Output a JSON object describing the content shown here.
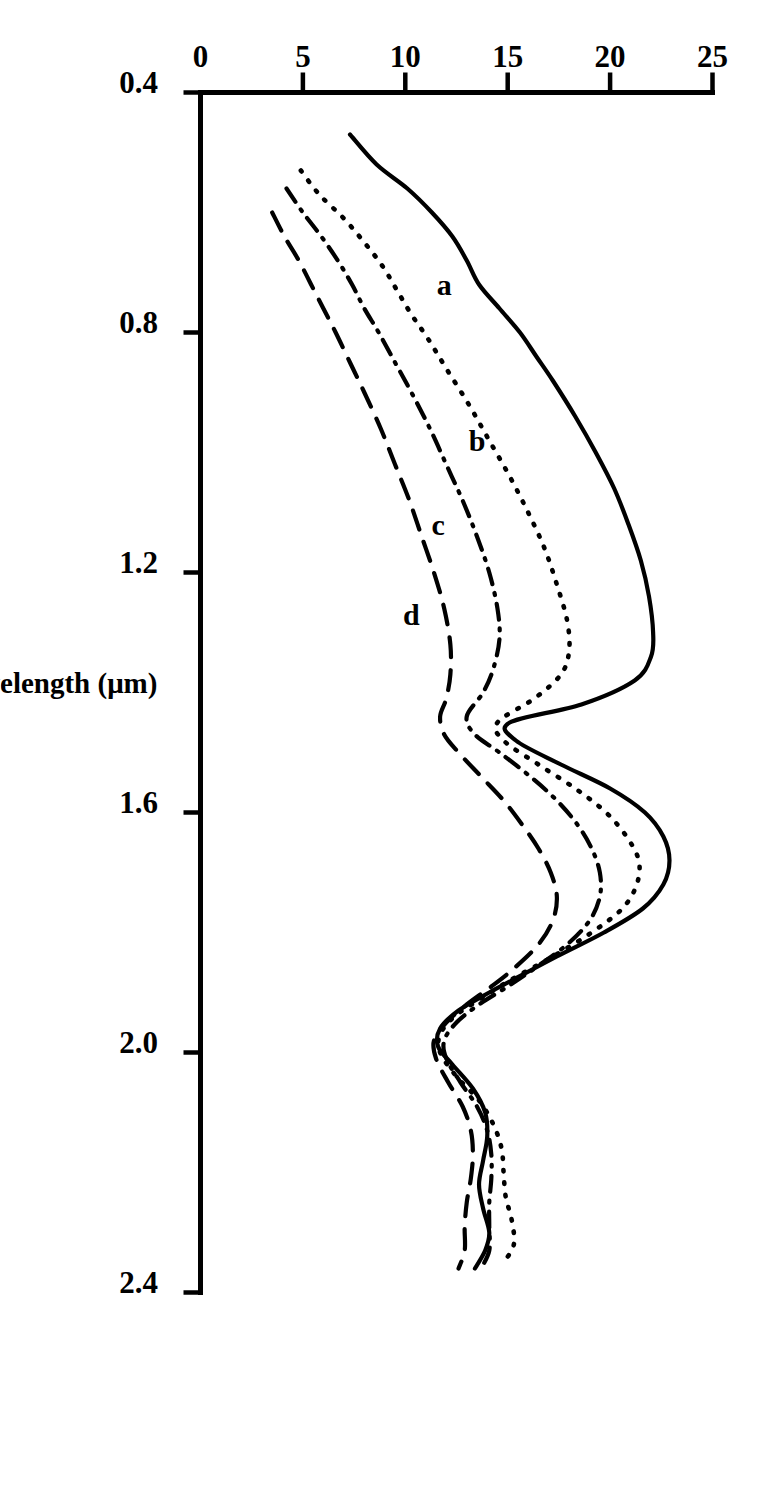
{
  "figure": {
    "rotation_degrees": 90,
    "background_color": "#ffffff",
    "ink_color": "#000000"
  },
  "chart_data": {
    "type": "line",
    "title": "",
    "xlabel": "Wavelength (μm)",
    "ylabel": "Reflectance factor (%)",
    "xlim": [
      0.4,
      2.4
    ],
    "ylim": [
      0,
      25
    ],
    "xticks": [
      "0.4",
      "0.8",
      "1.2",
      "1.6",
      "2.0",
      "2.4"
    ],
    "xtick_values": [
      0.4,
      0.8,
      1.2,
      1.6,
      2.0,
      2.4
    ],
    "yticks": [
      "0",
      "5",
      "10",
      "15",
      "20",
      "25"
    ],
    "ytick_values": [
      0,
      5,
      10,
      15,
      20,
      25
    ],
    "grid": false,
    "legend_position": "inline-curve-labels",
    "series": [
      {
        "name": "a",
        "label": "a",
        "linestyle": "solid",
        "label_x": 0.72,
        "label_y": 11.9,
        "x": [
          0.47,
          0.52,
          0.56,
          0.6,
          0.64,
          0.68,
          0.72,
          0.76,
          0.8,
          0.84,
          0.88,
          0.94,
          1.0,
          1.06,
          1.12,
          1.18,
          1.24,
          1.3,
          1.34,
          1.38,
          1.42,
          1.45,
          1.48,
          1.52,
          1.56,
          1.6,
          1.64,
          1.68,
          1.72,
          1.76,
          1.8,
          1.84,
          1.88,
          1.9,
          1.93,
          1.96,
          1.99,
          2.02,
          2.06,
          2.1,
          2.14,
          2.18,
          2.22,
          2.26,
          2.3,
          2.33,
          2.36
        ],
        "y": [
          7.3,
          8.6,
          10.1,
          11.3,
          12.3,
          13.0,
          13.6,
          14.6,
          15.6,
          16.4,
          17.2,
          18.3,
          19.3,
          20.2,
          20.9,
          21.5,
          21.9,
          22.1,
          22.0,
          21.2,
          18.6,
          15.1,
          15.4,
          17.6,
          20.0,
          21.7,
          22.6,
          22.9,
          22.6,
          21.6,
          19.7,
          17.4,
          15.2,
          14.1,
          12.6,
          11.7,
          11.6,
          12.3,
          13.3,
          13.9,
          14.0,
          13.8,
          13.6,
          13.8,
          14.1,
          13.9,
          13.4
        ]
      },
      {
        "name": "b",
        "label": "b",
        "linestyle": "dotted",
        "label_x": 0.98,
        "label_y": 13.5,
        "x": [
          0.53,
          0.57,
          0.61,
          0.65,
          0.69,
          0.73,
          0.77,
          0.81,
          0.86,
          0.92,
          0.98,
          1.04,
          1.1,
          1.16,
          1.22,
          1.28,
          1.33,
          1.37,
          1.41,
          1.45,
          1.48,
          1.52,
          1.56,
          1.6,
          1.64,
          1.68,
          1.72,
          1.76,
          1.8,
          1.84,
          1.88,
          1.91,
          1.94,
          1.97,
          2.0,
          2.04,
          2.08,
          2.12,
          2.16,
          2.2,
          2.24,
          2.28,
          2.32,
          2.35
        ],
        "y": [
          4.9,
          5.8,
          7.0,
          8.0,
          8.9,
          9.6,
          10.3,
          11.1,
          12.0,
          13.1,
          14.1,
          15.1,
          16.0,
          16.8,
          17.4,
          17.9,
          18.0,
          17.6,
          16.3,
          14.5,
          14.8,
          16.5,
          18.3,
          19.8,
          20.8,
          21.4,
          21.3,
          20.6,
          19.1,
          17.2,
          15.1,
          13.7,
          12.4,
          11.7,
          11.7,
          12.5,
          13.6,
          14.3,
          14.7,
          14.8,
          14.9,
          15.2,
          15.3,
          14.8
        ]
      },
      {
        "name": "c",
        "label": "c",
        "linestyle": "dash-dot",
        "label_x": 1.12,
        "label_y": 11.6,
        "x": [
          0.56,
          0.6,
          0.64,
          0.68,
          0.72,
          0.76,
          0.8,
          0.85,
          0.9,
          0.96,
          1.02,
          1.08,
          1.14,
          1.2,
          1.26,
          1.31,
          1.36,
          1.4,
          1.44,
          1.47,
          1.5,
          1.54,
          1.58,
          1.62,
          1.66,
          1.7,
          1.74,
          1.78,
          1.82,
          1.86,
          1.89,
          1.92,
          1.95,
          1.98,
          2.01,
          2.05,
          2.09,
          2.13,
          2.17,
          2.21,
          2.25,
          2.29,
          2.33,
          2.36
        ],
        "y": [
          4.2,
          5.0,
          5.9,
          6.7,
          7.4,
          8.0,
          8.7,
          9.5,
          10.3,
          11.2,
          12.0,
          12.8,
          13.5,
          14.1,
          14.5,
          14.6,
          14.3,
          13.8,
          13.0,
          13.4,
          14.6,
          16.1,
          17.4,
          18.4,
          19.1,
          19.5,
          19.5,
          19.0,
          17.9,
          16.3,
          15.0,
          13.6,
          12.5,
          11.9,
          12.0,
          12.7,
          13.5,
          14.0,
          14.2,
          14.2,
          14.1,
          14.1,
          14.1,
          13.7
        ]
      },
      {
        "name": "d",
        "label": "d",
        "linestyle": "dashed",
        "label_x": 1.27,
        "label_y": 10.3,
        "x": [
          0.6,
          0.64,
          0.68,
          0.72,
          0.76,
          0.8,
          0.85,
          0.9,
          0.96,
          1.02,
          1.08,
          1.14,
          1.2,
          1.26,
          1.32,
          1.37,
          1.41,
          1.44,
          1.47,
          1.5,
          1.54,
          1.58,
          1.62,
          1.66,
          1.7,
          1.74,
          1.78,
          1.82,
          1.86,
          1.89,
          1.92,
          1.95,
          1.98,
          2.01,
          2.05,
          2.09,
          2.13,
          2.17,
          2.21,
          2.25,
          2.29,
          2.33,
          2.36
        ],
        "y": [
          3.5,
          4.1,
          4.8,
          5.4,
          6.0,
          6.6,
          7.3,
          8.0,
          8.8,
          9.5,
          10.2,
          10.8,
          11.4,
          11.9,
          12.2,
          12.2,
          12.0,
          11.7,
          11.9,
          12.6,
          13.7,
          14.8,
          15.7,
          16.5,
          17.1,
          17.4,
          17.2,
          16.5,
          15.3,
          14.2,
          13.0,
          12.0,
          11.4,
          11.5,
          12.1,
          12.8,
          13.2,
          13.3,
          13.2,
          13.0,
          12.9,
          12.9,
          12.6
        ]
      }
    ]
  }
}
